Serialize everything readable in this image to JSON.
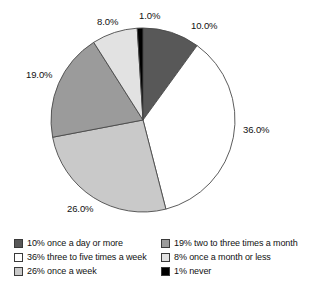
{
  "chart_data": {
    "type": "pie",
    "title": "",
    "categories": [
      "once a day or more",
      "three to five times a week",
      "once a week",
      "two to three times a month",
      "once a month or less",
      "never"
    ],
    "values": [
      10.0,
      36.0,
      26.0,
      19.0,
      8.0,
      1.0
    ],
    "value_labels": [
      "10.0%",
      "36.0%",
      "26.0%",
      "19.0%",
      "8.0%",
      "1.0%"
    ],
    "slice_colors": [
      "#585858",
      "#ffffff",
      "#c9c9c9",
      "#9b9b9b",
      "#e2e2e2",
      "#000000"
    ],
    "start_angle_deg": 0,
    "direction": "clockwise",
    "legend": {
      "position": "bottom",
      "columns": 2,
      "entries": [
        {
          "swatch": "#585858",
          "label": "10% once a day or more"
        },
        {
          "swatch": "#ffffff",
          "label": "36% three to five times a week"
        },
        {
          "swatch": "#c9c9c9",
          "label": "26% once a week"
        },
        {
          "swatch": "#9b9b9b",
          "label": "19% two to three times a month"
        },
        {
          "swatch": "#e2e2e2",
          "label": "8% once a month or less"
        },
        {
          "swatch": "#000000",
          "label": "1% never"
        }
      ]
    },
    "xlabel": "",
    "ylabel": "",
    "grid": false
  },
  "geometry": {
    "center_x": 143,
    "center_y": 120,
    "radius": 92
  },
  "label_positions": [
    {
      "text": "10.0%",
      "left": 191,
      "top": 20
    },
    {
      "text": "36.0%",
      "left": 243,
      "top": 124
    },
    {
      "text": "26.0%",
      "left": 67,
      "top": 203
    },
    {
      "text": "19.0%",
      "left": 26,
      "top": 69
    },
    {
      "text": "8.0%",
      "left": 97,
      "top": 16
    },
    {
      "text": "1.0%",
      "left": 139,
      "top": 10
    }
  ]
}
